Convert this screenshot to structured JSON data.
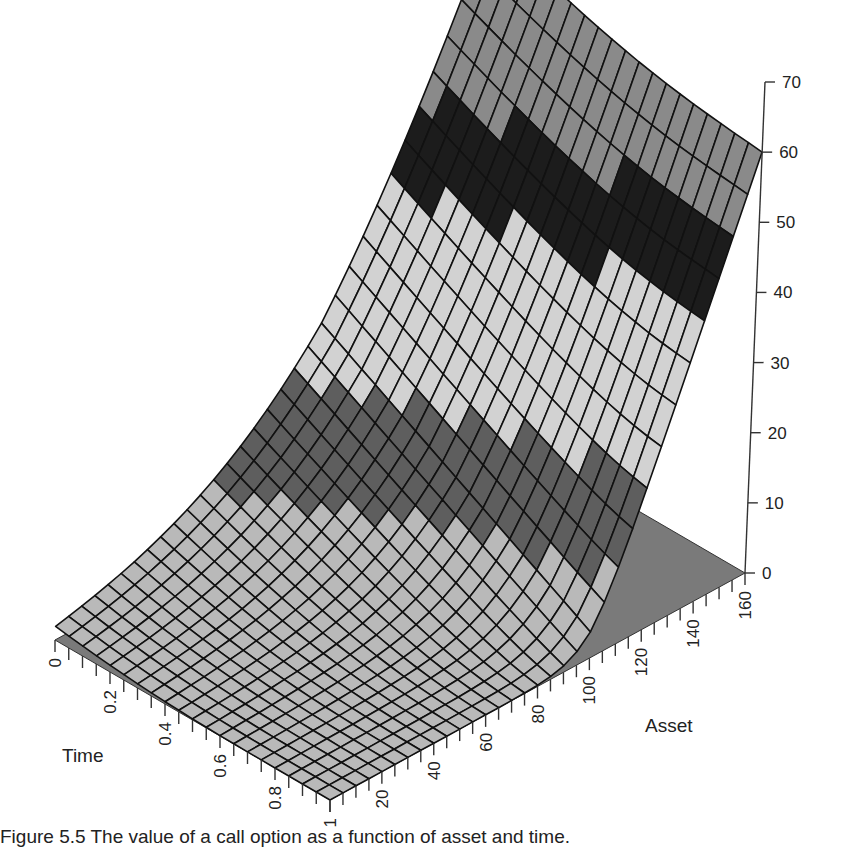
{
  "chart_data": {
    "type": "surface3d",
    "title": "",
    "caption": "Figure 5.5   The value of a call option as a function of asset and time.",
    "xlabel": "Time",
    "ylabel": "Asset",
    "zlabel": "",
    "x_ticks": [
      "0",
      "0.2",
      "0.4",
      "0.6",
      "0.8",
      "1"
    ],
    "x_range": [
      0,
      1
    ],
    "y_ticks": [
      "20",
      "40",
      "60",
      "80",
      "100",
      "120",
      "140",
      "160"
    ],
    "y_range": [
      0,
      160
    ],
    "z_ticks": [
      "0",
      "10",
      "20",
      "30",
      "40",
      "50",
      "60",
      "70"
    ],
    "z_range": [
      0,
      70
    ],
    "strike": 100,
    "grid": {
      "time_steps": 20,
      "asset_steps": 32
    },
    "shading_bands": [
      {
        "from": 0,
        "to": 10,
        "shade": "#b9b9b9"
      },
      {
        "from": 10,
        "to": 20,
        "shade": "#5e5e5e"
      },
      {
        "from": 20,
        "to": 40,
        "shade": "#d2d2d2"
      },
      {
        "from": 40,
        "to": 50,
        "shade": "#1c1c1c"
      },
      {
        "from": 50,
        "to": 70,
        "shade": "#8a8a8a"
      }
    ],
    "sample_values": [
      {
        "asset": 0,
        "time": 0,
        "value": 0
      },
      {
        "asset": 80,
        "time": 0,
        "value": 1
      },
      {
        "asset": 100,
        "time": 0,
        "value": 8
      },
      {
        "asset": 120,
        "time": 0,
        "value": 24
      },
      {
        "asset": 140,
        "time": 0,
        "value": 44
      },
      {
        "asset": 160,
        "time": 0,
        "value": 64
      },
      {
        "asset": 100,
        "time": 1,
        "value": 0
      },
      {
        "asset": 160,
        "time": 1,
        "value": 60
      }
    ],
    "colors": {
      "mesh": "#111111",
      "base": "#7a7a7a",
      "axis": "#333333"
    }
  }
}
